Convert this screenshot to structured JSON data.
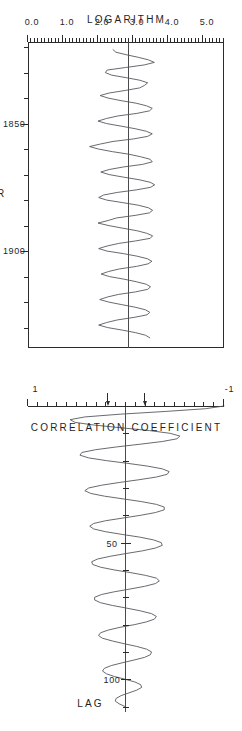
{
  "figure": {
    "orientation": "rotated-90-ccw",
    "background": "#ffffff",
    "ink_color": "#2b2b2b",
    "series_color": "#555a5f",
    "panel_count": 2
  },
  "chart_data": [
    {
      "id": "timeseries",
      "type": "line",
      "title": "",
      "xlabel": "YEAR",
      "ylabel": "LOGARITHM",
      "xlim": [
        1818,
        1938
      ],
      "ylim": [
        0.0,
        5.6
      ],
      "grid": false,
      "legend": "none",
      "xticks_major": [
        1850,
        1900
      ],
      "xtick_labels": [
        "1850",
        "1900"
      ],
      "xticks_minor_step": 10,
      "yticks_major": [
        0.0,
        1.0,
        2.0,
        3.0,
        4.0,
        5.0
      ],
      "ytick_labels": [
        "0.0",
        "1.0",
        "2.0",
        "3.0",
        "4.0",
        "5.0"
      ],
      "yticks_minor_step": 0.1,
      "reference_line": {
        "orientation": "horizontal",
        "value": 2.9,
        "label": ""
      },
      "x": [
        1821,
        1822,
        1823,
        1824,
        1825,
        1826,
        1827,
        1828,
        1829,
        1830,
        1831,
        1832,
        1833,
        1834,
        1835,
        1836,
        1837,
        1838,
        1839,
        1840,
        1841,
        1842,
        1843,
        1844,
        1845,
        1846,
        1847,
        1848,
        1849,
        1850,
        1851,
        1852,
        1853,
        1854,
        1855,
        1856,
        1857,
        1858,
        1859,
        1860,
        1861,
        1862,
        1863,
        1864,
        1865,
        1866,
        1867,
        1868,
        1869,
        1870,
        1871,
        1872,
        1873,
        1874,
        1875,
        1876,
        1877,
        1878,
        1879,
        1880,
        1881,
        1882,
        1883,
        1884,
        1885,
        1886,
        1887,
        1888,
        1889,
        1890,
        1891,
        1892,
        1893,
        1894,
        1895,
        1896,
        1897,
        1898,
        1899,
        1900,
        1901,
        1902,
        1903,
        1904,
        1905,
        1906,
        1907,
        1908,
        1909,
        1910,
        1911,
        1912,
        1913,
        1914,
        1915,
        1916,
        1917,
        1918,
        1919,
        1920,
        1921,
        1922,
        1923,
        1924,
        1925,
        1926,
        1927,
        1928,
        1929,
        1930,
        1931,
        1932,
        1933,
        1934
      ],
      "values": [
        2.43,
        2.51,
        2.81,
        3.15,
        3.44,
        3.61,
        3.32,
        2.79,
        2.26,
        2.21,
        2.39,
        2.81,
        3.2,
        3.42,
        3.33,
        3.19,
        2.78,
        2.32,
        2.06,
        2.29,
        2.66,
        3.09,
        3.38,
        3.55,
        3.47,
        3.11,
        2.57,
        2.24,
        2.0,
        2.25,
        2.66,
        3.06,
        3.38,
        3.55,
        3.42,
        3.02,
        2.43,
        2.07,
        1.76,
        2.02,
        2.41,
        2.88,
        3.22,
        3.49,
        3.55,
        3.27,
        2.73,
        2.32,
        2.08,
        2.32,
        2.73,
        3.17,
        3.49,
        3.62,
        3.5,
        3.09,
        2.55,
        2.16,
        2.02,
        2.25,
        2.71,
        3.15,
        3.44,
        3.56,
        3.47,
        3.06,
        2.53,
        2.29,
        2.0,
        2.31,
        2.7,
        3.11,
        3.39,
        3.56,
        3.49,
        3.08,
        2.59,
        2.26,
        2.02,
        2.26,
        2.73,
        3.12,
        3.41,
        3.54,
        3.43,
        3.1,
        2.61,
        2.3,
        2.09,
        2.33,
        2.74,
        3.09,
        3.38,
        3.5,
        3.42,
        3.07,
        2.58,
        2.27,
        2.05,
        2.31,
        2.68,
        3.06,
        3.35,
        3.48,
        3.4,
        3.03,
        2.55,
        2.25,
        2.02,
        2.28,
        2.7,
        3.08,
        3.36,
        3.48
      ]
    },
    {
      "id": "correlogram",
      "type": "line",
      "title": "",
      "xlabel": "LAG",
      "ylabel": "CORRELATION COEFFICIENT",
      "xlim": [
        0,
        112
      ],
      "ylim": [
        -1,
        1
      ],
      "grid": false,
      "legend": "none",
      "xticks_major": [
        50,
        100
      ],
      "xtick_labels": [
        "50",
        "100"
      ],
      "xticks_minor_step": 10,
      "yticks_major": [
        -1,
        1
      ],
      "ytick_labels": [
        "-1",
        "1"
      ],
      "yticks_minor_step": 0.1,
      "reference_line": {
        "orientation": "vertical_zero",
        "value": 0,
        "label": ""
      },
      "confidence_markers": {
        "type": "arrow",
        "count": 2,
        "values": [
          -0.19,
          0.19
        ]
      },
      "period": 9.5,
      "x": [
        0,
        1,
        2,
        3,
        4,
        5,
        6,
        7,
        8,
        9,
        10,
        11,
        12,
        13,
        14,
        15,
        16,
        17,
        18,
        19,
        20,
        21,
        22,
        23,
        24,
        25,
        26,
        27,
        28,
        29,
        30,
        31,
        32,
        33,
        34,
        35,
        36,
        37,
        38,
        39,
        40,
        41,
        42,
        43,
        44,
        45,
        46,
        47,
        48,
        49,
        50,
        51,
        52,
        53,
        54,
        55,
        56,
        57,
        58,
        59,
        60,
        61,
        62,
        63,
        64,
        65,
        66,
        67,
        68,
        69,
        70,
        71,
        72,
        73,
        74,
        75,
        76,
        77,
        78,
        79,
        80,
        81,
        82,
        83,
        84,
        85,
        86,
        87,
        88,
        89,
        90,
        91,
        92,
        93,
        94,
        95,
        96,
        97,
        98,
        99,
        100,
        101,
        102,
        103,
        104,
        105,
        106,
        107,
        108,
        109,
        110
      ],
      "values": [
        1.0,
        0.81,
        0.4,
        -0.06,
        -0.42,
        -0.57,
        -0.52,
        -0.32,
        -0.04,
        0.24,
        0.45,
        0.55,
        0.52,
        0.37,
        0.14,
        -0.1,
        -0.31,
        -0.45,
        -0.47,
        -0.38,
        -0.2,
        0.02,
        0.22,
        0.37,
        0.44,
        0.42,
        0.31,
        0.13,
        -0.07,
        -0.25,
        -0.38,
        -0.42,
        -0.36,
        -0.22,
        -0.03,
        0.16,
        0.31,
        0.39,
        0.39,
        0.3,
        0.15,
        -0.03,
        -0.21,
        -0.33,
        -0.37,
        -0.33,
        -0.21,
        -0.04,
        0.14,
        0.28,
        0.36,
        0.37,
        0.3,
        0.17,
        0.0,
        -0.16,
        -0.29,
        -0.35,
        -0.34,
        -0.26,
        -0.12,
        0.05,
        0.2,
        0.31,
        0.34,
        0.3,
        0.19,
        0.04,
        -0.12,
        -0.25,
        -0.32,
        -0.32,
        -0.26,
        -0.14,
        0.01,
        0.15,
        0.26,
        0.31,
        0.29,
        0.21,
        0.09,
        -0.06,
        -0.18,
        -0.26,
        -0.28,
        -0.24,
        -0.14,
        -0.02,
        0.11,
        0.21,
        0.26,
        0.25,
        0.19,
        0.08,
        -0.04,
        -0.15,
        -0.22,
        -0.24,
        -0.2,
        -0.12,
        -0.01,
        0.09,
        0.15,
        0.16,
        0.11,
        0.03,
        -0.05,
        -0.1,
        -0.11,
        -0.07,
        -0.01
      ]
    }
  ],
  "timeseries_axis": {
    "title": "YEAR",
    "value_title": "LOGARITHM",
    "x_labels": [
      "1850",
      "1900"
    ],
    "y_labels": [
      "0.0",
      "1.0",
      "2.0",
      "3.0",
      "4.0",
      "5.0"
    ]
  },
  "correlogram_axis": {
    "title": "LAG",
    "value_title": "CORRELATION  COEFFICIENT",
    "x_labels": [
      "50",
      "100"
    ],
    "y_labels": [
      "1",
      "-1"
    ]
  }
}
